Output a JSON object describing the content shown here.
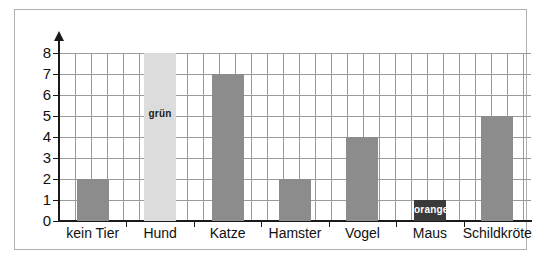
{
  "chart_data": {
    "type": "bar",
    "title": "",
    "subtitle": "",
    "xlabel": "",
    "ylabel": "",
    "categories": [
      "kein Tier",
      "Hund",
      "Katze",
      "Hamster",
      "Vogel",
      "Maus",
      "Schildkröte"
    ],
    "values": [
      2,
      8,
      7,
      2,
      4,
      1,
      5
    ],
    "ylim": [
      0,
      8
    ],
    "yticks": [
      "0",
      "1",
      "2",
      "3",
      "4",
      "5",
      "6",
      "7",
      "8"
    ],
    "grid": true,
    "legend": "none",
    "bar_colors": [
      "#8c8c8c",
      "#dcdcdc",
      "#8c8c8c",
      "#8c8c8c",
      "#8c8c8c",
      "#3a3a3a",
      "#8c8c8c"
    ],
    "annotations": [
      {
        "category": "Hund",
        "text": "grün",
        "text_color": "#1a1a1a"
      },
      {
        "category": "Maus",
        "text": "orange",
        "text_color": "#ffffff"
      }
    ]
  },
  "colors": {
    "bar_default": "#8c8c8c",
    "bar_light": "#dcdcdc",
    "bar_dark": "#3a3a3a",
    "grid": "#9a9a9a",
    "axis": "#1a1a1a",
    "frame": "#b0b0b0",
    "background": "#ffffff"
  },
  "annotations": {
    "gruen_label": "grün",
    "orange_label": "orange"
  }
}
